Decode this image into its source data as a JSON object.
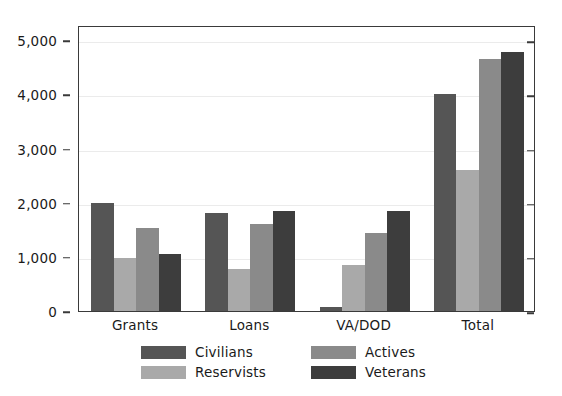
{
  "chart_data": {
    "type": "bar",
    "title": "",
    "xlabel": "",
    "ylabel": "",
    "categories": [
      "Grants",
      "Loans",
      "VA/DOD",
      "Total"
    ],
    "series": [
      {
        "name": "Civilians",
        "color": "#555555",
        "values": [
          2000,
          1810,
          75,
          4010
        ]
      },
      {
        "name": "Reservists",
        "color": "#a9a9a9",
        "values": [
          975,
          770,
          850,
          2600
        ]
      },
      {
        "name": "Actives",
        "color": "#8a8a8a",
        "values": [
          1525,
          1605,
          1440,
          4650
        ]
      },
      {
        "name": "Veterans",
        "color": "#3d3d3d",
        "values": [
          1050,
          1840,
          1840,
          4790
        ]
      }
    ],
    "ylim": [
      0,
      5280
    ],
    "yticks": [
      0,
      1000,
      2000,
      3000,
      4000,
      5000
    ],
    "ytick_labels": [
      "0",
      "1,000",
      "2,000",
      "3,000",
      "4,000",
      "5,000"
    ],
    "grid": true,
    "grid_axis": "y",
    "legend_position": "bottom",
    "legend_columns": 2,
    "frame": true,
    "axis_color": "#3a3a3a",
    "grid_color": "#ebebeb",
    "background": "#ffffff"
  }
}
